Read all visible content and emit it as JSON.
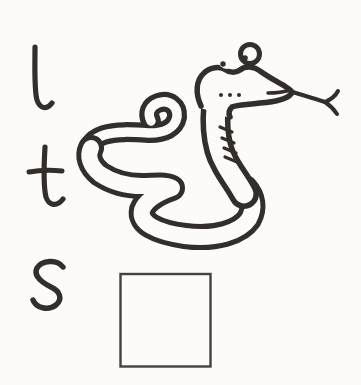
{
  "colors": {
    "ink": "#332e2b",
    "paper": "#fcfbf8",
    "box_border": "#444240"
  },
  "letter_choices": [
    {
      "label": "l"
    },
    {
      "label": "t"
    },
    {
      "label": "s"
    }
  ],
  "picture": {
    "name": "snake-drawing"
  },
  "answer_box": {
    "value": "",
    "label": "answer box"
  }
}
